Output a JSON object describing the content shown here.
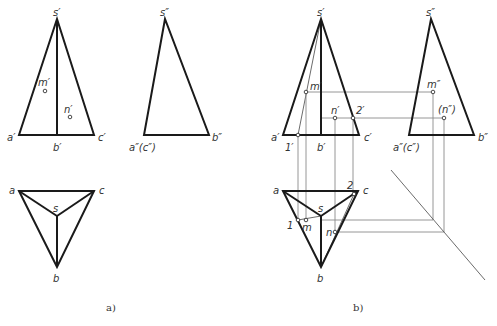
{
  "figure": {
    "panel_a": {
      "caption": "a)",
      "front_view": {
        "labels": {
          "s": "s′",
          "a": "a′",
          "b": "b′",
          "c": "c′",
          "m": "m′",
          "n": "n′"
        }
      },
      "side_view": {
        "labels": {
          "s": "s″",
          "ac": "a″(c″)",
          "b": "b″"
        }
      },
      "top_view": {
        "labels": {
          "a": "a",
          "c": "c",
          "s": "s",
          "b": "b"
        }
      }
    },
    "panel_b": {
      "caption": "b)",
      "front_view": {
        "labels": {
          "s": "s′",
          "a": "a′",
          "b": "b′",
          "c": "c′",
          "m": "m′",
          "n": "n′",
          "p1": "1′",
          "p2": "2′"
        }
      },
      "side_view": {
        "labels": {
          "s": "s″",
          "ac": "a″(c″)",
          "b": "b″",
          "m": "m″",
          "n": "(n″)"
        }
      },
      "top_view": {
        "labels": {
          "a": "a",
          "c": "c",
          "s": "s",
          "b": "b",
          "m": "m",
          "n": "n",
          "p1": "1",
          "p2": "2"
        }
      }
    },
    "colors": {
      "outline": "#1a1a1a",
      "construction": "#8a8a8a",
      "background": "#ffffff"
    }
  }
}
